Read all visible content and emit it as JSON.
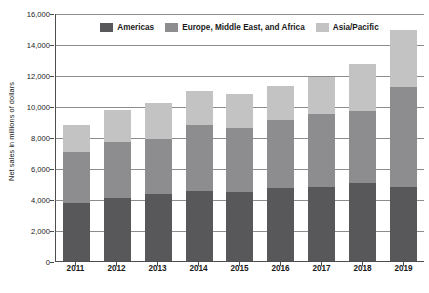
{
  "chart_data": {
    "type": "bar",
    "stacked": true,
    "title": "",
    "xlabel": "",
    "ylabel": "Net sales in millions of dollars",
    "categories": [
      "2011",
      "2012",
      "2013",
      "2014",
      "2015",
      "2016",
      "2017",
      "2018",
      "2019"
    ],
    "series": [
      {
        "name": "Americas",
        "color": "#58585a",
        "values": [
          3750,
          4050,
          4300,
          4520,
          4450,
          4700,
          4800,
          5050,
          4780
        ]
      },
      {
        "name": "Europe, Middle East, and Africa",
        "color": "#8d8d8f",
        "values": [
          3280,
          3600,
          3600,
          4230,
          4150,
          4400,
          4700,
          4650,
          6420
        ]
      },
      {
        "name": "Asia/Pacific",
        "color": "#c3c3c4",
        "values": [
          1770,
          2100,
          2300,
          2200,
          2200,
          2200,
          2350,
          3000,
          3700
        ]
      }
    ],
    "totals": [
      8800,
      9750,
      10200,
      10950,
      10800,
      11300,
      11850,
      12700,
      14900
    ],
    "ylim": [
      0,
      16000
    ],
    "ytick_values": [
      0,
      2000,
      4000,
      6000,
      8000,
      10000,
      12000,
      14000,
      16000
    ],
    "ytick_labels": [
      "0",
      "2,000",
      "4,000",
      "6,000",
      "8,000",
      "10,000",
      "12,000",
      "14,000",
      "16,000"
    ],
    "grid": true,
    "legend_position": "top-center"
  },
  "legend": {
    "items": [
      {
        "label": "Americas",
        "color": "#58585a"
      },
      {
        "label": "Europe, Middle East, and Africa",
        "color": "#8d8d8f"
      },
      {
        "label": "Asia/Pacific",
        "color": "#c3c3c4"
      }
    ]
  },
  "axes": {
    "y_title": "Net sales in millions of dollars"
  }
}
